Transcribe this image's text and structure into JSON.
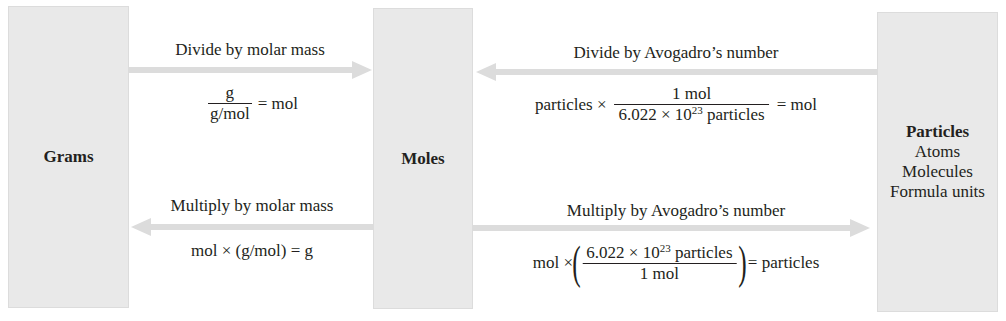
{
  "boxes": {
    "grams": {
      "title": "Grams"
    },
    "moles": {
      "title": "Moles"
    },
    "particles": {
      "title": "Particles",
      "items": [
        "Atoms",
        "Molecules",
        "Formula units"
      ]
    }
  },
  "arrows": {
    "grams_to_moles": {
      "label": "Divide by molar mass",
      "equation": {
        "numerator": "g",
        "denominator": "g/mol",
        "result": "= mol"
      }
    },
    "particles_to_moles": {
      "label": "Divide by Avogadro’s number",
      "equation": {
        "prefix": "particles ×",
        "numerator": "1 mol",
        "denominator_base": "6.022 × 10",
        "denominator_exp": "23",
        "denominator_unit": " particles",
        "result": "= mol"
      }
    },
    "moles_to_grams": {
      "label": "Multiply by molar mass",
      "equation": {
        "text": "mol × (g/mol) = g"
      }
    },
    "moles_to_particles": {
      "label": "Multiply by Avogadro’s number",
      "equation": {
        "prefix": "mol ×",
        "numerator_base": "6.022 × 10",
        "numerator_exp": "23",
        "numerator_unit": " particles",
        "denominator": "1 mol",
        "result": "= particles"
      }
    }
  },
  "colors": {
    "box_fill": "#e9e9e9",
    "arrow": "#d9d9d9",
    "text": "#231f20"
  }
}
